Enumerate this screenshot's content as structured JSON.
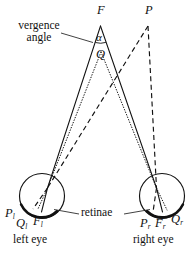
{
  "figure": {
    "title_points": {
      "fixation_top": "F",
      "object_top": "P",
      "midpoint": "Q",
      "angle_symbol": "α"
    },
    "annotations": {
      "vergence_line1": "vergence",
      "vergence_line2": "angle",
      "retinae": "retinae"
    },
    "left_eye": {
      "caption": "left eye",
      "image_p": "P",
      "image_p_sub": "l",
      "image_q": "Q",
      "image_q_sub": "l",
      "image_f": "F",
      "image_f_sub": "l"
    },
    "right_eye": {
      "caption": "right eye",
      "image_p": "P",
      "image_p_sub": "r",
      "image_f": "F",
      "image_f_sub": "r",
      "image_q": "Q",
      "image_q_sub": "r"
    },
    "colors": {
      "ink": "#111111",
      "background": "#ffffff"
    }
  }
}
